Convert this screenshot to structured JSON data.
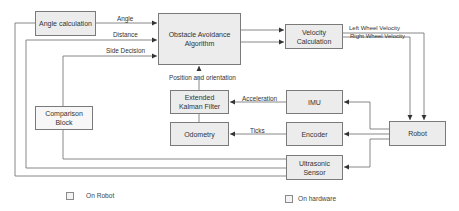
{
  "blocks": {
    "angle_calculation": "Angle calculation",
    "obstacle_avoidance": "Obstacle Avoidance Algorithm",
    "velocity_calculation": "Velocity Calculation",
    "comparison_block": "Comparison Block",
    "ekf": "Extended Kalman Filter",
    "odometry": "Odometry",
    "imu": "IMU",
    "encoder": "Encoder",
    "ultrasonic": "Ultrasonic Sensor",
    "robot": "Robot"
  },
  "edges": {
    "angle": "Angle",
    "distance": "Distance",
    "side_decision": "Side Decision",
    "position_orientation": "Position and orientation",
    "left_wheel": "Left Wheel Velocity",
    "right_wheel": "Right Wheel Velocity",
    "acceleration": "Acceleration",
    "ticks": "Ticks"
  },
  "legend": {
    "on_robot": "On Robot",
    "on_hardware": "On hardware"
  },
  "colors": {
    "box_fill": "#ececec",
    "box_border": "#7a7a7a",
    "wire": "#6a6a6a"
  }
}
